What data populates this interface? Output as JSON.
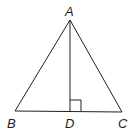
{
  "diagram": {
    "type": "geometry-triangle",
    "points": {
      "A": {
        "label": "A",
        "x": 70,
        "y": 20
      },
      "B": {
        "label": "B",
        "x": 15,
        "y": 111
      },
      "C": {
        "label": "C",
        "x": 122,
        "y": 112
      },
      "D": {
        "label": "D",
        "x": 70,
        "y": 111
      }
    },
    "segments": [
      "AB",
      "AC",
      "BC",
      "AD"
    ],
    "right_angle_marker": {
      "at": "D",
      "size": 11
    },
    "colors": {
      "stroke": "#231f20",
      "background": "#ffffff"
    }
  }
}
